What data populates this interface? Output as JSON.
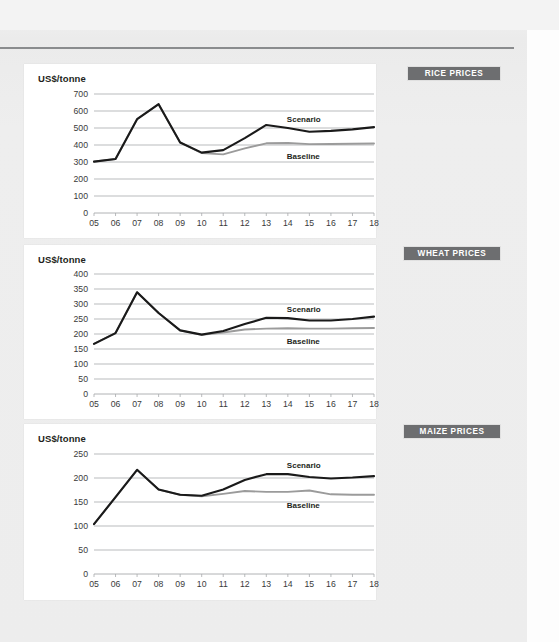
{
  "page": {
    "background_color": "#eeeeee",
    "panel_color": "#ffffff",
    "rule_color": "#8a8c8e",
    "tag_background": "#6d6e70",
    "tag_text_color": "#ffffff",
    "scenario_color": "#1a1a1a",
    "baseline_color": "#9b9b9b",
    "gridline_color": "#a7a9ac"
  },
  "sections": [
    {
      "tag": "RICE PRICES"
    },
    {
      "tag": "WHEAT PRICES"
    },
    {
      "tag": "MAIZE PRICES"
    }
  ],
  "chart_data": [
    {
      "type": "line",
      "title": "RICE PRICES",
      "ylabel": "US$/tonne",
      "xlabel": "",
      "grid": true,
      "legend_position": "inline-right",
      "ylim": [
        0,
        700
      ],
      "yticks": [
        0,
        100,
        200,
        300,
        400,
        500,
        600,
        700
      ],
      "categories": [
        "05",
        "06",
        "07",
        "08",
        "09",
        "10",
        "11",
        "12",
        "13",
        "14",
        "15",
        "16",
        "17",
        "18"
      ],
      "series": [
        {
          "name": "Baseline",
          "color": "#9b9b9b",
          "values": [
            302,
            318,
            552,
            640,
            415,
            352,
            345,
            380,
            410,
            412,
            405,
            406,
            407,
            409
          ]
        },
        {
          "name": "Scenario",
          "color": "#1a1a1a",
          "values": [
            302,
            318,
            552,
            640,
            415,
            355,
            370,
            440,
            518,
            500,
            478,
            483,
            492,
            505
          ]
        }
      ],
      "annotations": [
        {
          "text": "Scenario",
          "series": "Scenario"
        },
        {
          "text": "Baseline",
          "series": "Baseline"
        }
      ]
    },
    {
      "type": "line",
      "title": "WHEAT PRICES",
      "ylabel": "US$/tonne",
      "xlabel": "",
      "grid": true,
      "legend_position": "inline-right",
      "ylim": [
        0,
        400
      ],
      "yticks": [
        0,
        50,
        100,
        150,
        200,
        250,
        300,
        350,
        400
      ],
      "categories": [
        "05",
        "06",
        "07",
        "08",
        "09",
        "10",
        "11",
        "12",
        "13",
        "14",
        "15",
        "16",
        "17",
        "18"
      ],
      "series": [
        {
          "name": "Baseline",
          "color": "#9b9b9b",
          "values": [
            167,
            203,
            339,
            270,
            212,
            197,
            205,
            215,
            218,
            219,
            218,
            218,
            219,
            220
          ]
        },
        {
          "name": "Scenario",
          "color": "#1a1a1a",
          "values": [
            167,
            203,
            339,
            270,
            212,
            198,
            210,
            233,
            254,
            253,
            245,
            245,
            250,
            258
          ]
        }
      ],
      "annotations": [
        {
          "text": "Scenario",
          "series": "Scenario"
        },
        {
          "text": "Baseline",
          "series": "Baseline"
        }
      ]
    },
    {
      "type": "line",
      "title": "MAIZE PRICES",
      "ylabel": "US$/tonne",
      "xlabel": "",
      "grid": true,
      "legend_position": "inline-right",
      "ylim": [
        0,
        250
      ],
      "yticks": [
        0,
        50,
        100,
        150,
        200,
        250
      ],
      "categories": [
        "05",
        "06",
        "07",
        "08",
        "09",
        "10",
        "11",
        "12",
        "13",
        "14",
        "15",
        "16",
        "17",
        "18"
      ],
      "series": [
        {
          "name": "Baseline",
          "color": "#9b9b9b",
          "values": [
            104,
            160,
            217,
            176,
            165,
            162,
            167,
            173,
            171,
            171,
            174,
            166,
            165,
            165
          ]
        },
        {
          "name": "Scenario",
          "color": "#1a1a1a",
          "values": [
            104,
            160,
            217,
            176,
            165,
            163,
            176,
            196,
            208,
            208,
            202,
            199,
            201,
            204
          ]
        }
      ],
      "annotations": [
        {
          "text": "Scenario",
          "series": "Scenario"
        },
        {
          "text": "Baseline",
          "series": "Baseline"
        }
      ]
    }
  ]
}
